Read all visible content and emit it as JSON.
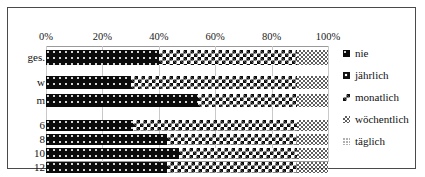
{
  "chart_data": {
    "type": "bar",
    "orientation": "horizontal",
    "stacked": true,
    "stack_mode": "percent",
    "title": "",
    "subtitle": "",
    "xlabel": "",
    "ylabel": "",
    "xlim": [
      0,
      100
    ],
    "xticks": [
      "0%",
      "20%",
      "40%",
      "60%",
      "80%",
      "100%"
    ],
    "xtick_values": [
      0,
      20,
      40,
      60,
      80,
      100
    ],
    "grid": true,
    "grid_axis": "x",
    "legend_position": "right",
    "categories": [
      "ges.",
      "w",
      "m",
      "6",
      "8",
      "10",
      "12"
    ],
    "series": [
      {
        "name": "nie",
        "key": "nie",
        "values": [
          40,
          30,
          54,
          31,
          43,
          47,
          43
        ]
      },
      {
        "name": "jährlich",
        "key": "jaehrlich",
        "values": [
          0,
          0,
          0,
          0,
          0,
          0,
          0
        ]
      },
      {
        "name": "monatlich",
        "key": "monatlich",
        "values": [
          49,
          59,
          35,
          58,
          46,
          42,
          46
        ]
      },
      {
        "name": "wöchentlich",
        "key": "woechentlich",
        "values": [
          11,
          11,
          11,
          11,
          11,
          11,
          11
        ]
      },
      {
        "name": "täglich",
        "key": "taeglich",
        "values": [
          0,
          0,
          0,
          0,
          0,
          0,
          0
        ]
      }
    ],
    "legend_entries": [
      "nie",
      "jährlich",
      "monatlich",
      "wöchentlich",
      "täglich"
    ]
  },
  "axis": {
    "x_ticks": [
      {
        "label": "0%",
        "value": 0
      },
      {
        "label": "20%",
        "value": 20
      },
      {
        "label": "40%",
        "value": 40
      },
      {
        "label": "60%",
        "value": 60
      },
      {
        "label": "80%",
        "value": 80
      },
      {
        "label": "100%",
        "value": 100
      }
    ]
  },
  "rows": [
    {
      "label": "ges.",
      "group": "total",
      "segments": [
        {
          "key": "nie",
          "pct": 40
        },
        {
          "key": "monatlich",
          "pct": 49
        },
        {
          "key": "woechentlich",
          "pct": 11
        }
      ]
    },
    {
      "label": "w",
      "group": "gender",
      "segments": [
        {
          "key": "nie",
          "pct": 30
        },
        {
          "key": "monatlich",
          "pct": 59
        },
        {
          "key": "woechentlich",
          "pct": 11
        }
      ]
    },
    {
      "label": "m",
      "group": "gender",
      "segments": [
        {
          "key": "nie",
          "pct": 54
        },
        {
          "key": "monatlich",
          "pct": 35
        },
        {
          "key": "woechentlich",
          "pct": 11
        }
      ]
    },
    {
      "label": "6",
      "group": "age",
      "segments": [
        {
          "key": "nie",
          "pct": 31
        },
        {
          "key": "monatlich",
          "pct": 58
        },
        {
          "key": "woechentlich",
          "pct": 11
        }
      ]
    },
    {
      "label": "8",
      "group": "age",
      "segments": [
        {
          "key": "nie",
          "pct": 43
        },
        {
          "key": "monatlich",
          "pct": 46
        },
        {
          "key": "woechentlich",
          "pct": 11
        }
      ]
    },
    {
      "label": "10",
      "group": "age",
      "segments": [
        {
          "key": "nie",
          "pct": 47
        },
        {
          "key": "monatlich",
          "pct": 42
        },
        {
          "key": "woechentlich",
          "pct": 11
        }
      ]
    },
    {
      "label": "12",
      "group": "age",
      "segments": [
        {
          "key": "nie",
          "pct": 43
        },
        {
          "key": "monatlich",
          "pct": 46
        },
        {
          "key": "woechentlich",
          "pct": 11
        }
      ]
    }
  ],
  "legend": {
    "items": [
      {
        "label": "nie",
        "key": "nie",
        "marker": "filled-square-swatch"
      },
      {
        "label": "jährlich",
        "key": "jaehrlich",
        "marker": "dotted-square-swatch"
      },
      {
        "label": "monatlich",
        "key": "monatlich",
        "marker": "checker-square-swatch"
      },
      {
        "label": "wöchentlich",
        "key": "woechentlich",
        "marker": "fine-checker-square-swatch"
      },
      {
        "label": "täglich",
        "key": "taeglich",
        "marker": "light-dot-square-swatch"
      }
    ]
  },
  "colors": {
    "nie": "#0b0b0b",
    "jaehrlich": "#111111",
    "monatlich": "#0d0d0d",
    "woechentlich": "#2a2a2a",
    "taeglich": "#555555",
    "grid": "#c9c9c9",
    "frame": "#4a4a4a",
    "background": "#ffffff",
    "text": "#111111"
  }
}
